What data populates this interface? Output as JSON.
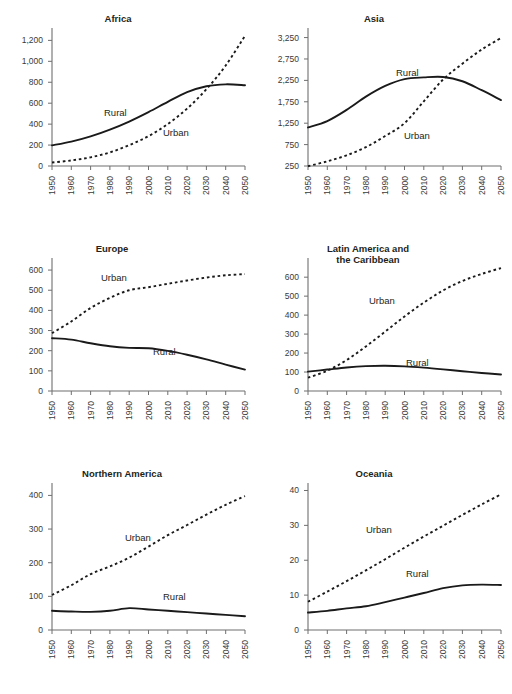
{
  "figure": {
    "background": "#ffffff",
    "series_names": [
      "Rural",
      "Urban"
    ],
    "rural_label": "Rural",
    "urban_label": "Urban",
    "line_color": "#1a1a1a",
    "axis_color": "#6f6f6f",
    "tick_label_color": "#3a3a3a",
    "title_color": "#231f20"
  },
  "chart_data": [
    {
      "type": "line",
      "title": "Africa",
      "title_lines": [
        "Africa"
      ],
      "xlabel": "",
      "ylabel": "",
      "x": [
        1950,
        1960,
        1970,
        1980,
        1990,
        2000,
        2010,
        2020,
        2030,
        2040,
        2050
      ],
      "xticks": [
        "1950",
        "1960",
        "1970",
        "1980",
        "1990",
        "2000",
        "2010",
        "2020",
        "2030",
        "2040",
        "2050"
      ],
      "yticks": [
        0,
        200,
        400,
        600,
        800,
        1000,
        1200
      ],
      "ytick_labels": [
        "0",
        "200",
        "400",
        "600",
        "800",
        "1,000",
        "1,200"
      ],
      "ylim": [
        0,
        1280
      ],
      "xlim": [
        1950,
        2050
      ],
      "grid": false,
      "legend": "inline-annotation",
      "series": [
        {
          "name": "Rural",
          "style": "solid",
          "values": [
            197,
            233,
            283,
            348,
            425,
            515,
            613,
            705,
            762,
            780,
            772
          ]
        },
        {
          "name": "Urban",
          "style": "dotted",
          "values": [
            33,
            53,
            83,
            130,
            199,
            285,
            401,
            548,
            733,
            960,
            1244
          ]
        }
      ]
    },
    {
      "type": "line",
      "title": "Asia",
      "title_lines": [
        "Asia"
      ],
      "xlabel": "",
      "ylabel": "",
      "x": [
        1950,
        1960,
        1970,
        1980,
        1990,
        2000,
        2010,
        2020,
        2030,
        2040,
        2050
      ],
      "xticks": [
        "1950",
        "1960",
        "1970",
        "1980",
        "1990",
        "2000",
        "2010",
        "2020",
        "2030",
        "2040",
        "2050"
      ],
      "yticks": [
        250,
        750,
        1250,
        1750,
        2250,
        2750,
        3250
      ],
      "ytick_labels": [
        "250",
        "750",
        "1,250",
        "1,750",
        "2,250",
        "2,750",
        "3,250"
      ],
      "ylim": [
        250,
        3380
      ],
      "xlim": [
        1950,
        2050
      ],
      "grid": false,
      "legend": "inline-annotation",
      "series": [
        {
          "name": "Rural",
          "style": "solid",
          "values": [
            1150,
            1300,
            1560,
            1870,
            2120,
            2280,
            2320,
            2330,
            2230,
            2020,
            1790
          ]
        },
        {
          "name": "Urban",
          "style": "dotted",
          "values": [
            245,
            360,
            500,
            690,
            950,
            1250,
            1760,
            2270,
            2640,
            2970,
            3240
          ]
        }
      ]
    },
    {
      "type": "line",
      "title": "Europe",
      "title_lines": [
        "Europe"
      ],
      "xlabel": "",
      "ylabel": "",
      "x": [
        1950,
        1960,
        1970,
        1980,
        1990,
        2000,
        2010,
        2020,
        2030,
        2040,
        2050
      ],
      "xticks": [
        "1950",
        "1960",
        "1970",
        "1980",
        "1990",
        "2000",
        "2010",
        "2020",
        "2030",
        "2040",
        "2050"
      ],
      "yticks": [
        0,
        100,
        200,
        300,
        400,
        500,
        600
      ],
      "ytick_labels": [
        "0",
        "100",
        "200",
        "300",
        "400",
        "500",
        "600"
      ],
      "ylim": [
        0,
        640
      ],
      "xlim": [
        1950,
        2050
      ],
      "grid": false,
      "legend": "inline-annotation",
      "series": [
        {
          "name": "Rural",
          "style": "solid",
          "values": [
            262,
            255,
            237,
            222,
            214,
            212,
            199,
            180,
            157,
            131,
            106
          ]
        },
        {
          "name": "Urban",
          "style": "dotted",
          "values": [
            287,
            345,
            412,
            462,
            500,
            515,
            532,
            548,
            563,
            574,
            580
          ]
        }
      ]
    },
    {
      "type": "line",
      "title": "Latin America and the Caribbean",
      "title_lines": [
        "Latin America and",
        "the Caribbean"
      ],
      "xlabel": "",
      "ylabel": "",
      "x": [
        1950,
        1960,
        1970,
        1980,
        1990,
        2000,
        2010,
        2020,
        2030,
        2040,
        2050
      ],
      "xticks": [
        "1950",
        "1960",
        "1970",
        "1980",
        "1990",
        "2000",
        "2010",
        "2020",
        "2030",
        "2040",
        "2050"
      ],
      "yticks": [
        0,
        100,
        200,
        300,
        400,
        500,
        600
      ],
      "ytick_labels": [
        "0",
        "100",
        "200",
        "300",
        "400",
        "500",
        "600"
      ],
      "ylim": [
        0,
        680
      ],
      "xlim": [
        1950,
        2050
      ],
      "grid": false,
      "legend": "inline-annotation",
      "series": [
        {
          "name": "Rural",
          "style": "solid",
          "values": [
            102,
            113,
            124,
            131,
            133,
            130,
            123,
            114,
            104,
            95,
            87
          ]
        },
        {
          "name": "Urban",
          "style": "dotted",
          "values": [
            70,
            107,
            163,
            235,
            313,
            393,
            466,
            530,
            580,
            617,
            648
          ]
        }
      ]
    },
    {
      "type": "line",
      "title": "Northern America",
      "title_lines": [
        "Northern America"
      ],
      "xlabel": "",
      "ylabel": "",
      "x": [
        1950,
        1960,
        1970,
        1980,
        1990,
        2000,
        2010,
        2020,
        2030,
        2040,
        2050
      ],
      "xticks": [
        "1950",
        "1960",
        "1970",
        "1980",
        "1990",
        "2000",
        "2010",
        "2020",
        "2030",
        "2040",
        "2050"
      ],
      "yticks": [
        0,
        100,
        200,
        300,
        400
      ],
      "ytick_labels": [
        "0",
        "100",
        "200",
        "300",
        "400"
      ],
      "ylim": [
        0,
        425
      ],
      "xlim": [
        1950,
        2050
      ],
      "grid": false,
      "legend": "inline-annotation",
      "series": [
        {
          "name": "Rural",
          "style": "solid",
          "values": [
            57,
            55,
            54,
            57,
            65,
            61,
            57,
            53,
            49,
            45,
            41
          ]
        },
        {
          "name": "Urban",
          "style": "dotted",
          "values": [
            104,
            133,
            166,
            189,
            215,
            248,
            282,
            312,
            343,
            372,
            398
          ]
        }
      ]
    },
    {
      "type": "line",
      "title": "Oceania",
      "title_lines": [
        "Oceania"
      ],
      "xlabel": "",
      "ylabel": "",
      "x": [
        1950,
        1960,
        1970,
        1980,
        1990,
        2000,
        2010,
        2020,
        2030,
        2040,
        2050
      ],
      "xticks": [
        "1950",
        "1960",
        "1970",
        "1980",
        "1990",
        "2000",
        "2010",
        "2020",
        "2030",
        "2040",
        "2050"
      ],
      "yticks": [
        0,
        10,
        20,
        30,
        40
      ],
      "ytick_labels": [
        "0",
        "10",
        "20",
        "30",
        "40"
      ],
      "ylim": [
        0,
        41
      ],
      "xlim": [
        1950,
        2050
      ],
      "grid": false,
      "legend": "inline-annotation",
      "series": [
        {
          "name": "Rural",
          "style": "solid",
          "values": [
            5.0,
            5.5,
            6.2,
            6.8,
            8.0,
            9.3,
            10.6,
            12.0,
            12.8,
            13.0,
            12.9
          ]
        },
        {
          "name": "Urban",
          "style": "dotted",
          "values": [
            8.1,
            11.0,
            14.0,
            17.1,
            20.3,
            23.6,
            26.8,
            29.9,
            33.0,
            36.0,
            38.9
          ]
        }
      ]
    }
  ],
  "panel_layout": [
    {
      "title_x": 118,
      "title_y": 22,
      "rural_label_x": 104,
      "rural_label_y": 116,
      "urban_label_x": 163,
      "urban_label_y": 136
    },
    {
      "title_x": 118,
      "title_y": 22,
      "rural_label_x": 140,
      "rural_label_y": 76,
      "urban_label_x": 148,
      "urban_label_y": 139
    },
    {
      "title_x": 112,
      "title_y": 22,
      "rural_label_x": 153,
      "rural_label_y": 355,
      "urban_label_x": 101,
      "urban_label_y": 281
    },
    {
      "title_x": 112,
      "title_y": 22,
      "rural_label_x": 150,
      "rural_label_y": 366,
      "urban_label_x": 113,
      "urban_label_y": 304
    },
    {
      "title_x": 122,
      "title_y": 22,
      "rural_label_x": 163,
      "rural_label_y": 600,
      "urban_label_x": 125,
      "urban_label_y": 541
    },
    {
      "title_x": 118,
      "title_y": 22,
      "rural_label_x": 150,
      "rural_label_y": 577,
      "urban_label_x": 110,
      "urban_label_y": 533
    }
  ]
}
